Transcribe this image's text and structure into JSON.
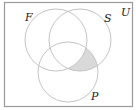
{
  "diagram": {
    "type": "venn",
    "universe_label": "U",
    "sets": [
      {
        "label": "F",
        "cx": 56,
        "cy": 40,
        "r": 31,
        "label_x": 25,
        "label_y": 21
      },
      {
        "label": "S",
        "cx": 80,
        "cy": 40,
        "r": 31,
        "label_x": 104,
        "label_y": 22
      },
      {
        "label": "P",
        "cx": 68,
        "cy": 72,
        "r": 30,
        "label_x": 91,
        "label_y": 100
      }
    ],
    "universe_label_pos": {
      "x": 121,
      "y": 16
    },
    "shaded_region": "S ∩ P ∩ F′",
    "colors": {
      "frame": "#9a9a9a",
      "circle": "#c4c4c4",
      "shade": "#d9d9d9",
      "text": "#222222"
    }
  }
}
